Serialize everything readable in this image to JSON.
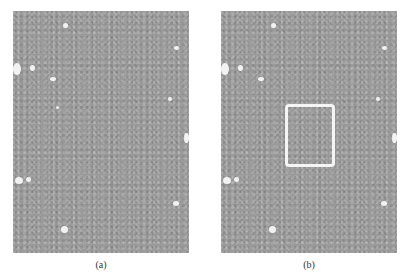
{
  "figure": {
    "panels": [
      {
        "id": "a",
        "caption": "(a)",
        "has_roi_box": false
      },
      {
        "id": "b",
        "caption": "(b)",
        "has_roi_box": true
      }
    ],
    "colors": {
      "background": "#ffffff",
      "image_gray": "#9a9a9a",
      "roi_box": "#f4f4f4"
    }
  }
}
